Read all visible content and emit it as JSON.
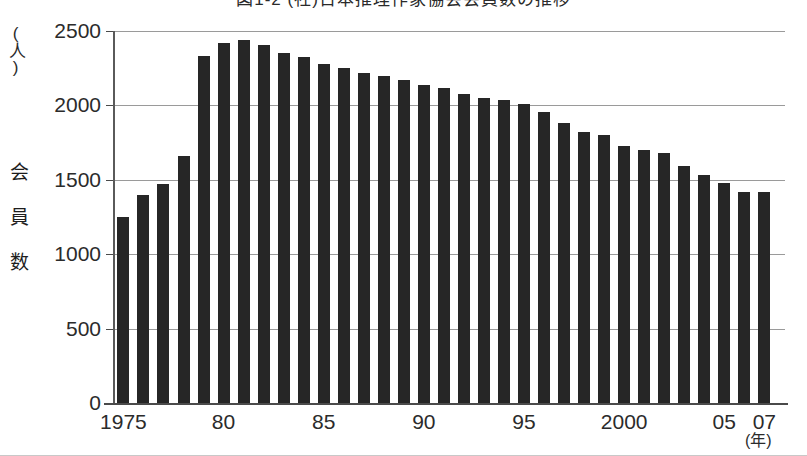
{
  "chart_data": {
    "type": "bar",
    "title": "図1-2 (社)日本推理作家協会会員数の推移",
    "xlabel": "(年)",
    "ylabel": "会員数",
    "yunit": "(人)",
    "ylim": [
      0,
      2500
    ],
    "yticks": [
      0,
      500,
      1000,
      1500,
      2000,
      2500
    ],
    "ytick_labels": [
      "0",
      "500",
      "1000",
      "1500",
      "2000",
      "2500"
    ],
    "grid": true,
    "legend": "none",
    "bar_color": "#262626",
    "categories": [
      "1975",
      "1976",
      "1977",
      "1978",
      "1979",
      "1980",
      "1981",
      "1982",
      "1983",
      "1984",
      "1985",
      "1986",
      "1987",
      "1988",
      "1989",
      "1990",
      "1991",
      "1992",
      "1993",
      "1994",
      "1995",
      "1996",
      "1997",
      "1998",
      "1999",
      "2000",
      "2001",
      "2002",
      "2003",
      "2004",
      "2005",
      "2006",
      "2007"
    ],
    "values": [
      1250,
      1395,
      1475,
      1660,
      2335,
      2420,
      2440,
      2405,
      2355,
      2325,
      2280,
      2250,
      2215,
      2200,
      2170,
      2140,
      2115,
      2075,
      2050,
      2035,
      2010,
      1955,
      1880,
      1820,
      1800,
      1725,
      1700,
      1680,
      1590,
      1535,
      1480,
      1420,
      1420
    ],
    "xtick_labels": [
      {
        "label": "1975",
        "index": 0
      },
      {
        "label": "80",
        "index": 5
      },
      {
        "label": "85",
        "index": 10
      },
      {
        "label": "90",
        "index": 15
      },
      {
        "label": "95",
        "index": 20
      },
      {
        "label": "2000",
        "index": 25
      },
      {
        "label": "05",
        "index": 30
      },
      {
        "label": "07",
        "index": 32
      }
    ]
  }
}
